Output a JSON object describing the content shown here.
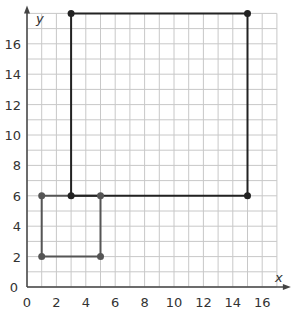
{
  "chart_data": {
    "type": "line",
    "title": "",
    "xlabel": "x",
    "ylabel": "y",
    "xlim": [
      0,
      17
    ],
    "ylim": [
      0,
      18
    ],
    "grid": true,
    "x_ticks": [
      0,
      2,
      4,
      6,
      8,
      10,
      12,
      14,
      16
    ],
    "y_ticks": [
      0,
      2,
      4,
      6,
      8,
      10,
      12,
      14,
      16
    ],
    "series": [
      {
        "name": "small-rectangle",
        "closed": true,
        "color": "#555555",
        "points": [
          [
            1,
            2
          ],
          [
            5,
            2
          ],
          [
            5,
            6
          ],
          [
            1,
            6
          ]
        ]
      },
      {
        "name": "large-rectangle",
        "closed": true,
        "color": "#222222",
        "points": [
          [
            3,
            6
          ],
          [
            15,
            6
          ],
          [
            15,
            18
          ],
          [
            3,
            18
          ]
        ]
      }
    ]
  }
}
